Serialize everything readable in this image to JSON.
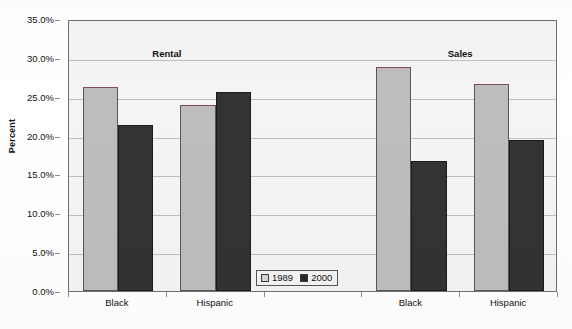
{
  "chart_data": {
    "type": "bar",
    "title": "",
    "xlabel": "",
    "ylabel": "Percent",
    "ylim": [
      0,
      35
    ],
    "grid": true,
    "legend_position": "bottom-center",
    "categories": [
      "Black",
      "Hispanic",
      "",
      "Black",
      "Hispanic"
    ],
    "group_labels": [
      "Rental",
      "Sales"
    ],
    "series": [
      {
        "name": "1989",
        "color": "#bdbdbd",
        "values": [
          26.3,
          23.9,
          null,
          28.8,
          26.6
        ]
      },
      {
        "name": "2000",
        "color": "#333333",
        "values": [
          21.4,
          25.6,
          null,
          16.7,
          19.4
        ]
      }
    ],
    "y_ticks": [
      "0.0%",
      "5.0%",
      "10.0%",
      "15.0%",
      "20.0%",
      "25.0%",
      "30.0%",
      "35.0%"
    ],
    "y_tick_values": [
      0,
      5,
      10,
      15,
      20,
      25,
      30,
      35
    ]
  },
  "axis": {
    "y_title": "Percent"
  },
  "sections": [
    {
      "label": "Rental"
    },
    {
      "label": "Sales"
    }
  ],
  "legend": {
    "items": [
      {
        "label": "1989",
        "swatch": "legend-swatch-1989"
      },
      {
        "label": "2000",
        "swatch": "legend-swatch-2000"
      }
    ]
  },
  "x_categories": [
    {
      "label": "Black"
    },
    {
      "label": "Hispanic"
    },
    {
      "label": ""
    },
    {
      "label": "Black"
    },
    {
      "label": "Hispanic"
    }
  ]
}
